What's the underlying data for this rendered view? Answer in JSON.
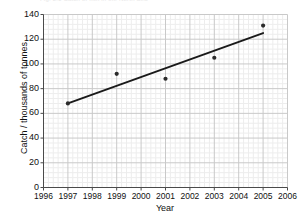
{
  "chart_data": {
    "type": "scatter",
    "title": "",
    "cropped_title_remnant": "Fig. 2.1 Catch of fish in the North Sea",
    "xlabel": "Year",
    "ylabel": "Catch / thousands of tonnes",
    "x": [
      1997,
      1999,
      2001,
      2003,
      2005
    ],
    "values": [
      68,
      92,
      88,
      105,
      131
    ],
    "series": [
      {
        "name": "Catch",
        "x": [
          1997,
          1999,
          2001,
          2003,
          2005
        ],
        "values": [
          68,
          92,
          88,
          105,
          131
        ],
        "marker": "dot",
        "color": "#2b2b2b"
      },
      {
        "name": "Line of best fit",
        "type": "line",
        "x": [
          1997,
          2005
        ],
        "values": [
          68,
          125
        ],
        "color": "#1a1a1a"
      }
    ],
    "xlim": [
      1996,
      2006
    ],
    "ylim": [
      0,
      140
    ],
    "xticks": [
      1996,
      1997,
      1998,
      1999,
      2000,
      2001,
      2002,
      2003,
      2004,
      2005,
      2006
    ],
    "xtick_labels": [
      "1996",
      "1997",
      "1998",
      "1999",
      "2000",
      "2001",
      "2002",
      "2003",
      "2004",
      "2005",
      "2006"
    ],
    "yticks": [
      0,
      20,
      40,
      60,
      80,
      100,
      120,
      140
    ],
    "ytick_labels": [
      "0",
      "20",
      "40",
      "60",
      "80",
      "100",
      "120",
      "140"
    ],
    "grid": true,
    "minor_grid": true,
    "minor_grid_divisions": 5,
    "legend": false,
    "legend_position": "none",
    "colors": {
      "major_grid": "#c9c9c9",
      "minor_grid": "#ededed",
      "axis": "#4a4a4a",
      "marker": "#2b2b2b",
      "trend_line": "#1a1a1a",
      "text": "#111111",
      "background": "#ffffff"
    }
  }
}
